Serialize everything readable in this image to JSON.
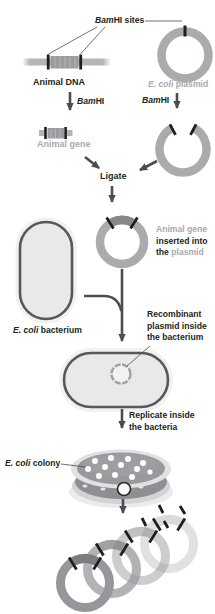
{
  "labels": {
    "bamhi_sites": {
      "italic": "Bam",
      "rest": "HI sites"
    },
    "animal_dna": "Animal DNA",
    "bamhi_left": {
      "italic": "Bam",
      "rest": "HI"
    },
    "bamhi_right": {
      "italic": "Bam",
      "rest": "HI"
    },
    "ecoli_plasmid": {
      "italic": "E. coli",
      "rest": " plasmid"
    },
    "animal_gene": "Animal gene",
    "ligate": "Ligate",
    "insert_note": {
      "line1": "Animal gene",
      "line2": "inserted into",
      "line3_black": "the ",
      "line3_gray": "plasmid"
    },
    "ecoli_bacterium": {
      "italic": "E. coli",
      "rest": " bacterium"
    },
    "recombinant_note": {
      "line1": "Recombinant",
      "line2": "plasmid inside",
      "line3": "the bacterium"
    },
    "replicate_note": {
      "line1": "Replicate inside",
      "line2": "the bacteria"
    },
    "ecoli_colony": {
      "italic": "E. coli",
      "rest": " colony"
    }
  },
  "colors": {
    "text_black": "#231f20",
    "text_gray": "#a7a9ac",
    "ring_gray": "#a9abad",
    "insert_gray": "#85878a",
    "arrow": "#4d4d4f",
    "tick_black": "#1e1e1e",
    "cell_fill": "#e8e9ea",
    "cell_border": "#57585a",
    "dish_top": "#97999c",
    "dish_side": "#8d8f92",
    "dish_rim": "#e0e1e2",
    "colony_white": "#ffffff",
    "bottom_ring": "#96979a",
    "bottom_insert": "#7b7d80"
  }
}
